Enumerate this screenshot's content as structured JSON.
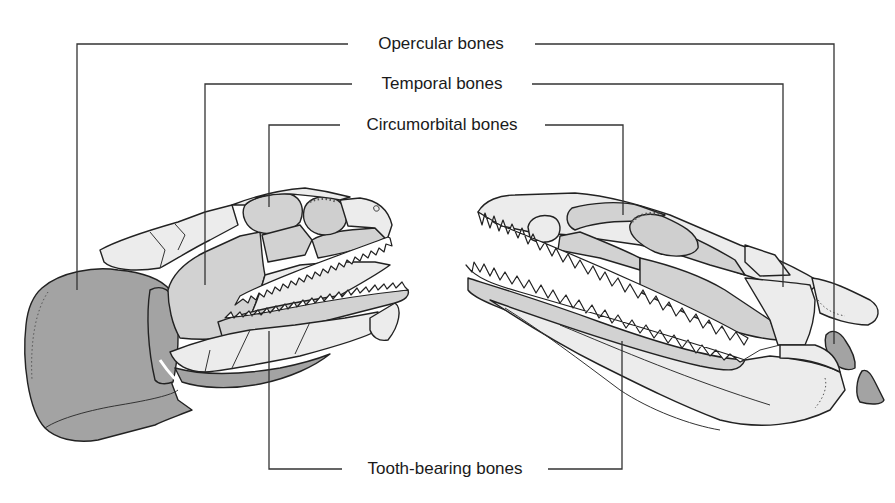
{
  "figure": {
    "labels": {
      "opercular": "Opercular bones",
      "temporal": "Temporal bones",
      "circumorbital": "Circumorbital bones",
      "tooth_bearing": "Tooth-bearing bones"
    },
    "shading_legend": {
      "opercular_fill": "#a3a3a3",
      "highlighted_fill": "#d2d2d2",
      "other_bone_fill": "#ececec",
      "line_color": "#222222"
    }
  }
}
